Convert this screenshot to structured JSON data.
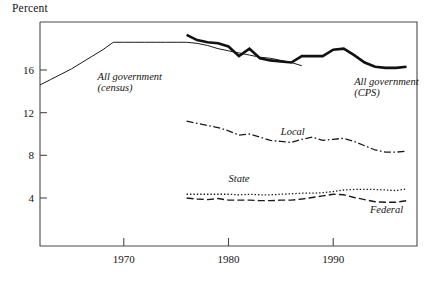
{
  "chart_data": {
    "type": "line",
    "title": "Percent",
    "xlabel": "",
    "ylabel": "Percent",
    "xlim": [
      1962,
      1998
    ],
    "ylim": [
      0,
      21
    ],
    "grid": false,
    "legend_position": "inline-annotations",
    "xticks": [
      1970,
      1980,
      1990
    ],
    "xtick_labels": [
      "1970",
      "1980",
      "1990"
    ],
    "yticks": [
      4,
      8,
      12,
      16
    ],
    "ytick_labels": [
      "4",
      "8",
      "12",
      "16"
    ],
    "annotations": [
      {
        "name": "all-government-census",
        "text_line1": "All government",
        "text_line2": "(census)",
        "x": 1967.5,
        "y": 15.1
      },
      {
        "name": "all-government-cps",
        "text_line1": "All government",
        "text_line2": "(CPS)",
        "x": 1992.0,
        "y": 14.6
      },
      {
        "name": "local",
        "text_line1": "Local",
        "text_line2": "",
        "x": 1985.0,
        "y": 9.9
      },
      {
        "name": "state",
        "text_line1": "State",
        "text_line2": "",
        "x": 1980.0,
        "y": 5.5
      },
      {
        "name": "federal",
        "text_line1": "Federal",
        "text_line2": "",
        "x": 1993.5,
        "y": 2.6
      }
    ],
    "series": [
      {
        "name": "All government (census)",
        "style": "solid-thin",
        "color": "#1a1a1a",
        "x": [
          1962,
          1963,
          1964,
          1965,
          1966,
          1967,
          1968,
          1969,
          1970,
          1971,
          1972,
          1973,
          1974,
          1975,
          1976,
          1977,
          1978,
          1979,
          1980,
          1981,
          1982,
          1983,
          1984,
          1985,
          1986,
          1987
        ],
        "values": [
          14.6,
          15.1,
          15.6,
          16.1,
          16.7,
          17.3,
          17.9,
          18.6,
          18.6,
          18.6,
          18.6,
          18.6,
          18.6,
          18.6,
          18.6,
          18.5,
          18.3,
          18.0,
          17.8,
          17.6,
          17.4,
          17.2,
          17.1,
          16.9,
          16.7,
          16.4
        ]
      },
      {
        "name": "All government (CPS)",
        "style": "solid-thick",
        "color": "#111111",
        "x": [
          1976,
          1977,
          1978,
          1979,
          1980,
          1981,
          1982,
          1983,
          1984,
          1985,
          1986,
          1987,
          1988,
          1989,
          1990,
          1991,
          1992,
          1993,
          1994,
          1995,
          1996,
          1997
        ],
        "values": [
          19.3,
          18.8,
          18.6,
          18.5,
          18.2,
          17.3,
          18.0,
          17.1,
          16.9,
          16.8,
          16.7,
          17.3,
          17.3,
          17.3,
          17.9,
          18.0,
          17.4,
          16.7,
          16.3,
          16.2,
          16.2,
          16.3
        ]
      },
      {
        "name": "Local",
        "style": "dash-dot",
        "color": "#1a1a1a",
        "x": [
          1976,
          1977,
          1978,
          1979,
          1980,
          1981,
          1982,
          1983,
          1984,
          1985,
          1986,
          1987,
          1988,
          1989,
          1990,
          1991,
          1992,
          1993,
          1994,
          1995,
          1996,
          1997
        ],
        "values": [
          11.2,
          11.0,
          10.8,
          10.6,
          10.3,
          9.9,
          10.0,
          9.7,
          9.4,
          9.3,
          9.2,
          9.5,
          9.7,
          9.4,
          9.5,
          9.6,
          9.3,
          8.9,
          8.5,
          8.3,
          8.3,
          8.4
        ]
      },
      {
        "name": "State",
        "style": "dotted",
        "color": "#1a1a1a",
        "x": [
          1976,
          1977,
          1978,
          1979,
          1980,
          1981,
          1982,
          1983,
          1984,
          1985,
          1986,
          1987,
          1988,
          1989,
          1990,
          1991,
          1992,
          1993,
          1994,
          1995,
          1996,
          1997
        ],
        "values": [
          4.35,
          4.35,
          4.35,
          4.35,
          4.35,
          4.3,
          4.35,
          4.3,
          4.3,
          4.35,
          4.4,
          4.45,
          4.45,
          4.5,
          4.6,
          4.75,
          4.8,
          4.8,
          4.8,
          4.75,
          4.7,
          4.85
        ]
      },
      {
        "name": "Federal",
        "style": "dashed",
        "color": "#1a1a1a",
        "x": [
          1976,
          1977,
          1978,
          1979,
          1980,
          1981,
          1982,
          1983,
          1984,
          1985,
          1986,
          1987,
          1988,
          1989,
          1990,
          1991,
          1992,
          1993,
          1994,
          1995,
          1996,
          1997
        ],
        "values": [
          4.0,
          3.9,
          3.85,
          3.95,
          3.8,
          3.8,
          3.8,
          3.75,
          3.75,
          3.8,
          3.8,
          3.9,
          4.05,
          4.2,
          4.35,
          4.3,
          4.05,
          3.85,
          3.65,
          3.6,
          3.6,
          3.75
        ]
      }
    ]
  }
}
